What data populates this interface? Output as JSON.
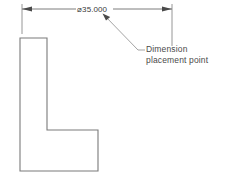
{
  "drawing": {
    "title": "CAD dimension placement illustration",
    "background_color": "#ffffff",
    "line_color": "#6e6e6e",
    "text_color": "#4a4a4a",
    "dimension": {
      "symbol": "⌀",
      "value": "35.000",
      "label": "⌀35.000",
      "line_y": 9,
      "left_extension_x": 22,
      "right_extension_x": 172,
      "arrow_style": "filled-arrowhead"
    },
    "annotation": {
      "line1": "Dimension",
      "line2": "placement point",
      "leader_from_x": 103,
      "leader_from_y": 14,
      "leader_to_x": 138,
      "leader_to_y": 50
    },
    "part": {
      "name": "L-bracket-profile",
      "outline_points": "20,38 47,38 47,130 98,130 98,171 20,171"
    }
  }
}
